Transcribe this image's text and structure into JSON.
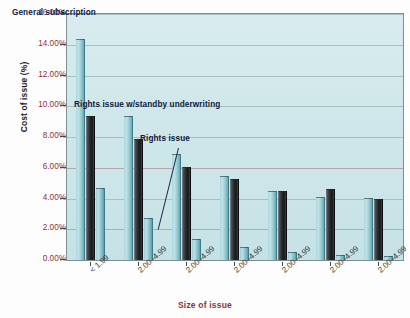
{
  "chart_data": {
    "type": "bar",
    "title": "",
    "xlabel": "Size of issue",
    "ylabel": "Cost of issue (%)",
    "ylim": [
      0,
      16
    ],
    "ytick_labels": [
      "16.00%",
      "14.00%",
      "12.00%",
      "10.00%",
      "8.00%",
      "6.00%",
      "4.00%",
      "2.00%",
      "0.00%"
    ],
    "ytick_values": [
      16,
      14,
      12,
      10,
      8,
      6,
      4,
      2,
      0
    ],
    "grid": true,
    "legend_position": "in-plot annotations",
    "categories": [
      "< 1.99",
      "2.00–4.99",
      "2.00–4.99",
      "2.00–4.99",
      "2.00–4.99",
      "2.00–4.99",
      "2.00–4.99"
    ],
    "series": [
      {
        "name": "General subscription",
        "color": "#9ccdd6",
        "values": [
          14.4,
          9.35,
          6.9,
          5.45,
          4.5,
          4.1,
          4.05
        ]
      },
      {
        "name": "Rights issue w/standby underwriting",
        "color": "#232626",
        "values": [
          9.35,
          7.9,
          6.05,
          5.3,
          4.5,
          4.65,
          3.95
        ]
      },
      {
        "name": "Rights issue",
        "color": "#8cc4ce",
        "values": [
          4.7,
          2.75,
          1.35,
          0.85,
          0.55,
          0.3,
          0.25
        ]
      }
    ],
    "annotations": [
      {
        "text": "General subscription",
        "target_series": "General subscription"
      },
      {
        "text": "Rights issue w/standby underwriting",
        "target_series": "Rights issue w/standby underwriting"
      },
      {
        "text": "Rights issue",
        "target_series": "Rights issue"
      }
    ]
  },
  "axes": {
    "y_title": "Cost of issue (%)",
    "x_title": "Size of issue"
  }
}
